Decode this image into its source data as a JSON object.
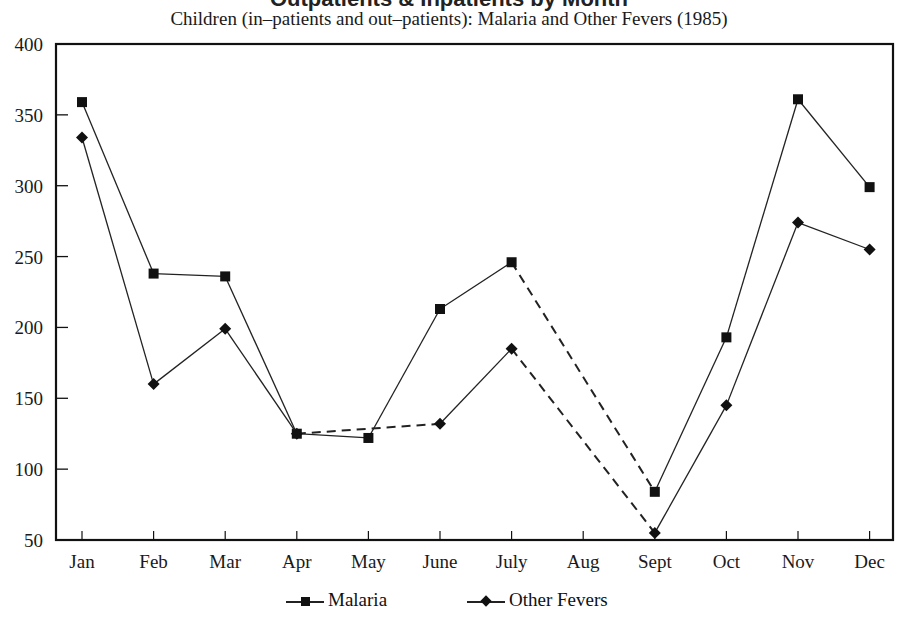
{
  "header": {
    "cut_title": "Outpatients & Inpatients by Month",
    "subtitle": "Children (in–patients and out–patients):  Malaria and Other Fevers (1985)"
  },
  "legend": {
    "malaria_label": "Malaria",
    "other_label": "Other Fevers"
  },
  "chart_data": {
    "type": "line",
    "title": "Children (in–patients and out–patients):  Malaria and Other Fevers (1985)",
    "xlabel": "",
    "ylabel": "",
    "categories": [
      "Jan",
      "Feb",
      "Mar",
      "Apr",
      "May",
      "June",
      "July",
      "Aug",
      "Sept",
      "Oct",
      "Nov",
      "Dec"
    ],
    "ylim": [
      50,
      400
    ],
    "yticks": [
      50,
      100,
      150,
      200,
      250,
      300,
      350,
      400
    ],
    "grid": false,
    "legend_position": "bottom",
    "series": [
      {
        "name": "Malaria",
        "marker": "square",
        "values": [
          359,
          238,
          236,
          125,
          122,
          213,
          246,
          null,
          84,
          193,
          361,
          299
        ]
      },
      {
        "name": "Other Fevers",
        "marker": "diamond",
        "values": [
          334,
          160,
          199,
          125,
          null,
          132,
          185,
          null,
          55,
          145,
          274,
          255
        ]
      }
    ],
    "annotations": [
      "Dashed lines bridge months with missing data (Other Fevers Apr–June, both series July–Sept)"
    ]
  }
}
